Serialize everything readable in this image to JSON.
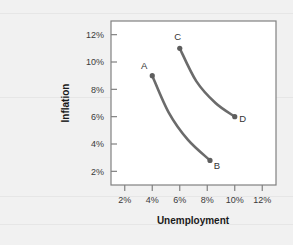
{
  "chart_data": {
    "type": "line",
    "title": "",
    "xlabel": "Unemployment",
    "ylabel": "Inflation",
    "xlim": [
      1,
      13
    ],
    "ylim": [
      1,
      13
    ],
    "grid": false,
    "legend": "none",
    "xticks": [
      "2%",
      "4%",
      "6%",
      "8%",
      "10%",
      "12%"
    ],
    "xtick_values": [
      2,
      4,
      6,
      8,
      10,
      12
    ],
    "yticks": [
      "2%",
      "4%",
      "6%",
      "8%",
      "10%",
      "12%"
    ],
    "ytick_values": [
      2,
      4,
      6,
      8,
      10,
      12
    ],
    "series": [
      {
        "name": "short-run Phillips curve 1",
        "color": "#6b6b6b",
        "points": [
          {
            "label": "A",
            "x": 4.0,
            "y": 9.0
          },
          {
            "label": "",
            "x": 5.2,
            "y": 6.3
          },
          {
            "label": "",
            "x": 6.6,
            "y": 4.3
          },
          {
            "label": "B",
            "x": 8.2,
            "y": 2.8
          }
        ]
      },
      {
        "name": "short-run Phillips curve 2",
        "color": "#6b6b6b",
        "points": [
          {
            "label": "C",
            "x": 6.0,
            "y": 11.0
          },
          {
            "label": "",
            "x": 7.2,
            "y": 8.6
          },
          {
            "label": "",
            "x": 8.6,
            "y": 7.0
          },
          {
            "label": "D",
            "x": 10.0,
            "y": 6.0
          }
        ]
      }
    ],
    "annotations": [
      {
        "name": "point-a",
        "text": "A",
        "x": 4.0,
        "y": 9.0
      },
      {
        "name": "point-b",
        "text": "B",
        "x": 8.2,
        "y": 2.8
      },
      {
        "name": "point-c",
        "text": "C",
        "x": 6.0,
        "y": 11.0
      },
      {
        "name": "point-d",
        "text": "D",
        "x": 10.0,
        "y": 6.0
      }
    ]
  },
  "axes": {
    "x_title": "Unemployment",
    "y_title": "Inflation",
    "x_labels": [
      "2%",
      "4%",
      "6%",
      "8%",
      "10%",
      "12%"
    ],
    "y_labels": [
      "12%",
      "10%",
      "8%",
      "6%",
      "4%",
      "2%"
    ]
  },
  "labels": {
    "a": "A",
    "b": "B",
    "c": "C",
    "d": "D"
  },
  "colors": {
    "curve": "#6b6b6b",
    "axis": "#808080",
    "background": "#f1f1f1",
    "plot_background": "#ffffff",
    "text": "#333333"
  }
}
